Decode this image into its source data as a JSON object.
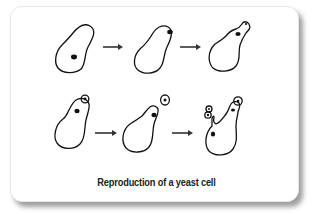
{
  "title": "Reproduction of a yeast cell",
  "stages": [
    {
      "row": 1,
      "label": "cell-with-nucleus",
      "buds": 0
    },
    {
      "row": 1,
      "label": "bud-emerging",
      "buds": 0
    },
    {
      "row": 1,
      "label": "nucleus-migrates-into-bud",
      "buds": 1
    },
    {
      "row": 2,
      "label": "bud-growing",
      "buds": 1
    },
    {
      "row": 2,
      "label": "bud-separates",
      "buds": 1
    },
    {
      "row": 2,
      "label": "chain-of-buds",
      "buds": 3
    }
  ],
  "arrows": [
    {
      "from": 1,
      "to": 2
    },
    {
      "from": 2,
      "to": 3
    },
    {
      "from": 4,
      "to": 5
    },
    {
      "from": 5,
      "to": 6
    }
  ],
  "colors": {
    "line": "#111111",
    "shadow": "#7a7a7a",
    "background": "#ffffff"
  }
}
